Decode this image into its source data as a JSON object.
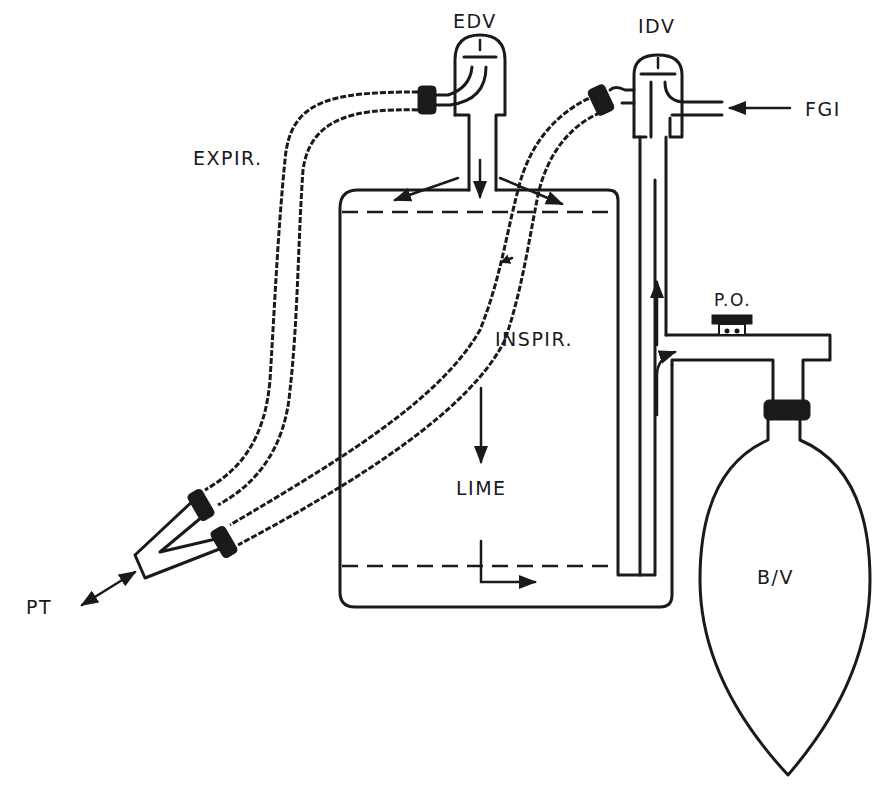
{
  "diagram": {
    "type": "anesthesia circle breathing system schematic",
    "labels": {
      "edv": "EDV",
      "idv": "IDV",
      "fgi": "FGI",
      "expir": "EXPIR.",
      "inspir": "INSPIR.",
      "lime": "LIME",
      "po": "P.O.",
      "pt": "PT",
      "bv": "B/V"
    },
    "colors": {
      "ink": "#1a1a1a",
      "background": "#ffffff"
    }
  }
}
